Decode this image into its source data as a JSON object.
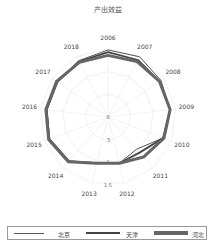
{
  "chart_data": {
    "type": "radar",
    "title": "产出效益",
    "categories": [
      "2006",
      "2007",
      "2008",
      "2009",
      "2010",
      "2011",
      "2012",
      "2013",
      "2014",
      "2015",
      "2016",
      "2017",
      "2018"
    ],
    "radial_ticks": [
      "0",
      ".5",
      "1",
      "1.5"
    ],
    "rlim": [
      0,
      1.5
    ],
    "legend_position": "bottom",
    "series": [
      {
        "name": "北京",
        "color": "#555555",
        "values": [
          1.48,
          1.5,
          1.42,
          1.38,
          1.3,
          0.95,
          1.05,
          1.05,
          1.3,
          1.38,
          1.35,
          1.35,
          1.4
        ]
      },
      {
        "name": "天津",
        "color": "#444444",
        "values": [
          1.43,
          1.42,
          1.38,
          1.38,
          1.3,
          1.05,
          1.05,
          1.05,
          1.3,
          1.38,
          1.37,
          1.36,
          1.38
        ]
      },
      {
        "name": "河北",
        "color": "#666666",
        "values": [
          1.36,
          1.38,
          1.38,
          1.38,
          1.32,
          1.18,
          1.05,
          1.05,
          1.32,
          1.4,
          1.38,
          1.38,
          1.36
        ]
      }
    ]
  }
}
